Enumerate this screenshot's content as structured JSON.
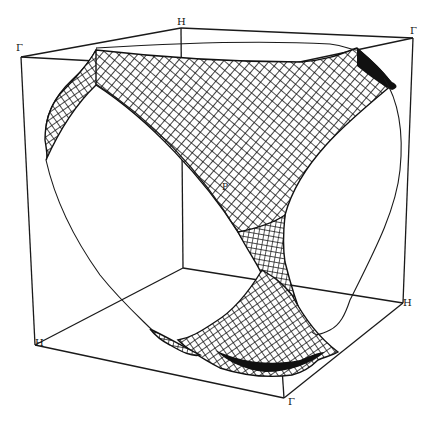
{
  "figure": {
    "title": "",
    "colors": {
      "line": "#1a1a1a",
      "background": "#ffffff"
    },
    "corner_labels": {
      "top_left": "Γ",
      "top_back": "H",
      "top_right": "Γ",
      "bottom_left": "H",
      "right_middle": "H",
      "bottom_front": "Γ"
    },
    "point_label": "P"
  }
}
